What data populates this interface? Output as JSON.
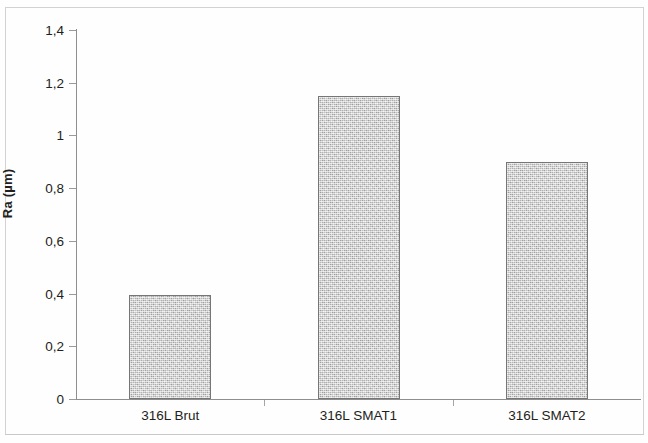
{
  "chart_data": {
    "type": "bar",
    "title": "",
    "xlabel": "",
    "ylabel": "Ra (µm)",
    "categories": [
      "316L Brut",
      "316L SMAT1",
      "316L SMAT2"
    ],
    "values": [
      0.395,
      1.15,
      0.9
    ],
    "ylim": [
      0,
      1.4
    ],
    "ytick_labels": [
      "0",
      "0,2",
      "0,4",
      "0,6",
      "0,8",
      "1",
      "1,2",
      "1,4"
    ],
    "ytick_values": [
      0,
      0.2,
      0.4,
      0.6,
      0.8,
      1.0,
      1.2,
      1.4
    ],
    "grid": false,
    "legend": false,
    "decimal_separator": ",",
    "bar_fill_color": "#c3c3c3",
    "bar_border_color": "#767676",
    "axis_color": "#8e8e8e",
    "text_color": "#231f20",
    "background_color": "#fefefe",
    "series": [
      {
        "name": "Ra",
        "values": [
          0.395,
          1.15,
          0.9
        ]
      }
    ]
  }
}
